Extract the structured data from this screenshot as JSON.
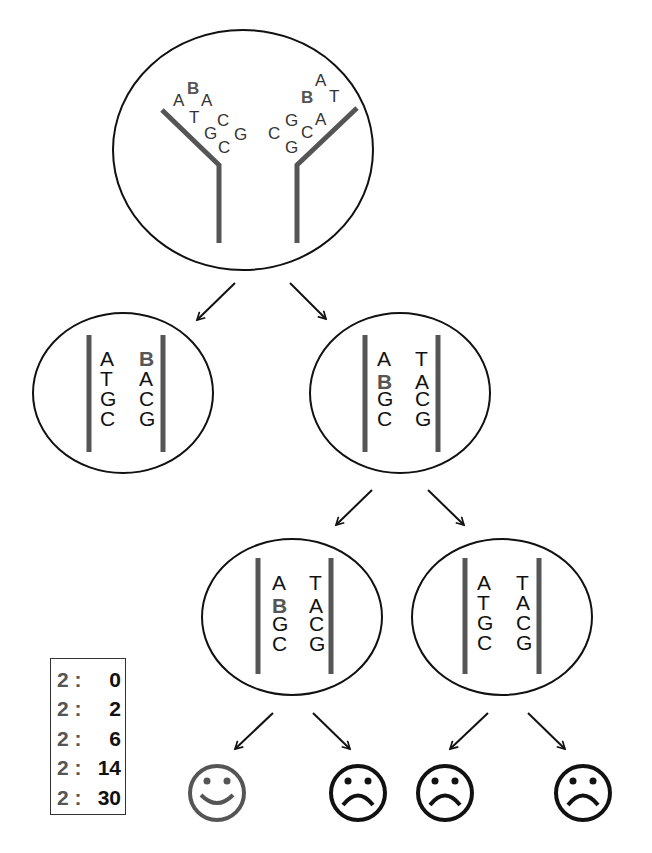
{
  "colors": {
    "strand": "#555555",
    "outline": "#111111",
    "highlight_base": "#555555",
    "happy_face": "#555555",
    "sad_face": "#111111"
  },
  "top_cell": {
    "left_fork_letters": [
      "A",
      "B",
      "A",
      "T",
      "C",
      "G",
      "G",
      "C"
    ],
    "right_fork_letters": [
      "A",
      "B",
      "T",
      "G",
      "A",
      "C",
      "C",
      "G"
    ],
    "highlight": "B"
  },
  "row2": [
    {
      "left_strand": [
        "A",
        "T",
        "G",
        "C"
      ],
      "right_strand": [
        "B",
        "A",
        "C",
        "G"
      ],
      "highlight": "right-0"
    },
    {
      "left_strand": [
        "A",
        "B",
        "G",
        "C"
      ],
      "right_strand": [
        "T",
        "A",
        "C",
        "G"
      ],
      "highlight": "left-1"
    }
  ],
  "row3": [
    {
      "left_strand": [
        "A",
        "B",
        "G",
        "C"
      ],
      "right_strand": [
        "T",
        "A",
        "C",
        "G"
      ],
      "highlight": "left-1"
    },
    {
      "left_strand": [
        "A",
        "T",
        "G",
        "C"
      ],
      "right_strand": [
        "T",
        "A",
        "C",
        "G"
      ],
      "highlight": "none"
    }
  ],
  "faces": [
    {
      "type": "happy"
    },
    {
      "type": "sad"
    },
    {
      "type": "sad"
    },
    {
      "type": "sad"
    }
  ],
  "legend": {
    "rows": [
      {
        "left": "2 :",
        "right": "0"
      },
      {
        "left": "2 :",
        "right": "2"
      },
      {
        "left": "2 :",
        "right": "6"
      },
      {
        "left": "2 :",
        "right": "14"
      },
      {
        "left": "2 :",
        "right": "30"
      }
    ]
  }
}
